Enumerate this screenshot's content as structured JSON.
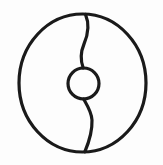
{
  "figure": {
    "title": "Circular symbol with S-divider and central ring",
    "background_color": "#fdfdfd",
    "stroke_color": "#1a1a1a",
    "canvas": {
      "width": 163,
      "height": 165
    },
    "elements": {
      "outer_circle": {
        "name": "outer-circle",
        "center_x": 82.5,
        "center_y": 83.0,
        "radius_x": 63.5,
        "radius_y": 69.0,
        "stroke_width": 3.2
      },
      "inner_circle": {
        "name": "inner-circle",
        "center_x": 83.5,
        "center_y": 83.5,
        "radius": 15.5,
        "stroke_width": 3.2
      },
      "upper_curve": {
        "name": "upper-s-curve",
        "path": "M 85.5 14.4 C 89.5 24.0 88.8 33.0 84.0 44.0 C 80.2 53.0 80.6 61.0 83.2 68.0",
        "stroke_width": 3.2
      },
      "lower_curve": {
        "name": "lower-s-curve",
        "path": "M 83.6 99.0 C 87.0 105.0 91.5 111.5 92.0 120.0 C 92.4 130.5 89.0 142.0 84.8 151.8",
        "stroke_width": 3.2
      }
    }
  }
}
